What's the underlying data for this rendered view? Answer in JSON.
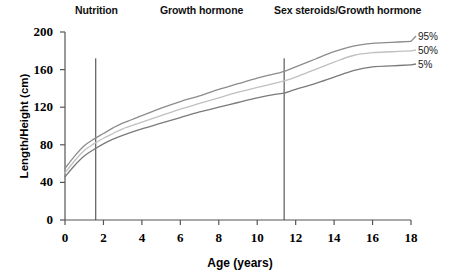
{
  "chart_data": {
    "type": "line",
    "title": "",
    "xlabel": "Age (years)",
    "ylabel": "Length/Height (cm)",
    "xlim": [
      0,
      18
    ],
    "ylim": [
      0,
      200
    ],
    "xticks": [
      0,
      2,
      4,
      6,
      8,
      10,
      12,
      14,
      16,
      18
    ],
    "yticks": [
      0,
      40,
      80,
      120,
      160,
      200
    ],
    "grid": false,
    "legend_position": "right-inline-end-of-line",
    "x": [
      0,
      0.5,
      1,
      1.5,
      2,
      2.5,
      3,
      4,
      5,
      6,
      7,
      8,
      9,
      10,
      11,
      11.4,
      12,
      13,
      14,
      15,
      16,
      17,
      18
    ],
    "series": [
      {
        "name": "95%",
        "label": "95%",
        "color": "#8c8c8c",
        "values": [
          55,
          68,
          79,
          86,
          92,
          98,
          103,
          111,
          119,
          126,
          132,
          139,
          145,
          151,
          156,
          158,
          163,
          171,
          179,
          185,
          188,
          189,
          190
        ]
      },
      {
        "name": "50%",
        "label": "50%",
        "color": "#c0c0c0",
        "values": [
          50,
          63,
          74,
          81,
          87,
          92,
          97,
          104,
          111,
          118,
          124,
          130,
          136,
          141,
          146,
          148,
          152,
          160,
          168,
          175,
          178,
          179,
          180
        ]
      },
      {
        "name": "5%",
        "label": "5%",
        "color": "#7a7a7a",
        "values": [
          46,
          58,
          68,
          75,
          81,
          86,
          90,
          97,
          103,
          109,
          115,
          120,
          125,
          130,
          134,
          135,
          139,
          145,
          152,
          159,
          163,
          164,
          165
        ]
      }
    ],
    "annotations": [
      {
        "name": "nutrition",
        "text": "Nutrition",
        "phase_start": 0,
        "phase_end": 1.6
      },
      {
        "name": "growth-hormone",
        "text": "Growth hormone",
        "phase_start": 1.6,
        "phase_end": 11.4
      },
      {
        "name": "sex-steroids-growth-hormone",
        "text": "Sex steroids/Growth hormone",
        "phase_start": 11.4,
        "phase_end": 18
      }
    ],
    "dividers": [
      {
        "name": "divider-nutrition-gh",
        "x": 1.6,
        "y_top": 172,
        "y_bottom": 0
      },
      {
        "name": "divider-gh-puberty",
        "x": 11.4,
        "y_top": 172,
        "y_bottom": 0
      }
    ],
    "axis_color": "#555555",
    "text_color": "#000000"
  },
  "labels": {
    "phases": {
      "nutrition": "Nutrition",
      "growth_hormone": "Growth hormone",
      "sex_steroids": "Sex steroids/Growth hormone"
    },
    "legend": {
      "p95": "95%",
      "p50": "50%",
      "p5": "5%"
    },
    "axes": {
      "x_title": "Age (years)",
      "y_title": "Length/Height (cm)"
    },
    "yticks": {
      "t0": "0",
      "t40": "40",
      "t80": "80",
      "t120": "120",
      "t160": "160",
      "t200": "200"
    },
    "xticks": {
      "t0": "0",
      "t2": "2",
      "t4": "4",
      "t6": "6",
      "t8": "8",
      "t10": "10",
      "t12": "12",
      "t14": "14",
      "t16": "16",
      "t18": "18"
    }
  }
}
